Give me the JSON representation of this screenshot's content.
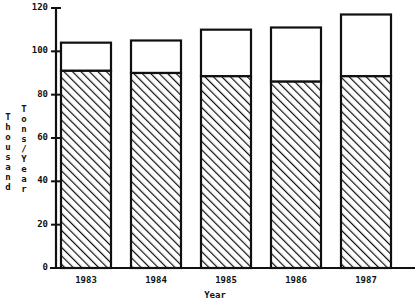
{
  "chart_data": {
    "type": "bar",
    "title": "",
    "subtitle": "",
    "xlabel": "Year",
    "ylabel": "Thousand Tons/Year",
    "ylabel_lines": [
      "Thousand",
      "Tons/Year"
    ],
    "categories": [
      "1983",
      "1984",
      "1985",
      "1986",
      "1987"
    ],
    "ylim": [
      0,
      120
    ],
    "yticks": [
      0,
      20,
      40,
      60,
      80,
      100,
      120
    ],
    "ytick_labels": [
      "0",
      "20",
      "40",
      "60",
      "80",
      "100",
      "120"
    ],
    "grid": false,
    "legend": "none",
    "stacked": true,
    "series": [
      {
        "name": "hatched-lower-segment",
        "fill": "diagonal-hatch",
        "values": [
          91,
          90,
          88.5,
          86,
          88.5
        ]
      },
      {
        "name": "white-upper-segment",
        "fill": "solid-white",
        "values": [
          13,
          15,
          21.5,
          25,
          28.5
        ]
      }
    ],
    "totals": [
      104,
      105,
      110,
      111,
      117
    ],
    "colors": {
      "axis": "#101010",
      "bar_outline": "#101010",
      "bar_upper_fill": "#ffffff",
      "bar_hatch_line": "#101010",
      "background": "#ffffff"
    }
  },
  "axes": {
    "x_title": "Year",
    "y_title_outer": "Thousand",
    "y_title_inner": "Tons/Year"
  }
}
